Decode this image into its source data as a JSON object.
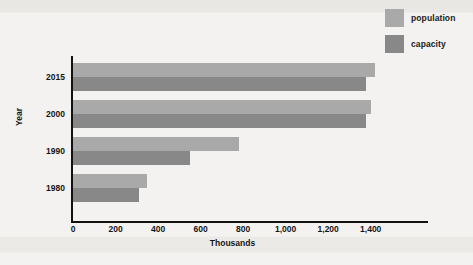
{
  "chart_data": {
    "type": "bar",
    "orientation": "horizontal",
    "title": "",
    "subtitle": "",
    "xlabel": "Thousands",
    "ylabel": "Year",
    "categories": [
      "2015",
      "2000",
      "1990",
      "1980"
    ],
    "series": [
      {
        "name": "population",
        "color": "#a9a9a9",
        "values": [
          1420,
          1400,
          780,
          350
        ]
      },
      {
        "name": "capacity",
        "color": "#888888",
        "values": [
          1380,
          1380,
          550,
          310
        ]
      }
    ],
    "xlim": [
      0,
      1500
    ],
    "xticks": [
      0,
      200,
      400,
      600,
      800,
      1000,
      1200,
      1400
    ],
    "xtick_labels": [
      "0",
      "200",
      "400",
      "600",
      "800",
      "1,000",
      "1,200",
      "1,400"
    ],
    "grid": false,
    "legend_position": "top-right",
    "background_color": "#f3f2f0",
    "axis_color": "#111111"
  },
  "legend": {
    "entries": [
      {
        "label": "population",
        "color": "#a9a9a9"
      },
      {
        "label": "capacity",
        "color": "#888888"
      }
    ]
  }
}
